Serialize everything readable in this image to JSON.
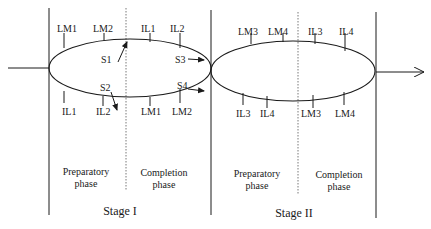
{
  "diagram": {
    "type": "two-stage process cycle",
    "colors": {
      "line": "#1a1a1a",
      "dotted": "#555555",
      "background": "#ffffff"
    },
    "stages": [
      {
        "id": "stage1",
        "label": "Stage I",
        "phases": [
          {
            "label_line1": "Preparatory",
            "label_line2": "phase"
          },
          {
            "label_line1": "Completion",
            "label_line2": "phase"
          }
        ],
        "top_ticks": [
          "LM1",
          "LM2",
          "IL1",
          "IL2"
        ],
        "bottom_ticks": [
          "IL1",
          "IL2",
          "LM1",
          "LM2"
        ],
        "arrows": [
          "S1",
          "S2",
          "S3",
          "S4"
        ]
      },
      {
        "id": "stage2",
        "label": "Stage II",
        "phases": [
          {
            "label_line1": "Preparatory",
            "label_line2": "phase"
          },
          {
            "label_line1": "Completion",
            "label_line2": "phase"
          }
        ],
        "top_ticks": [
          "LM3",
          "LM4",
          "IL3",
          "IL4"
        ],
        "bottom_ticks": [
          "IL3",
          "IL4",
          "LM3",
          "LM4"
        ]
      }
    ]
  }
}
